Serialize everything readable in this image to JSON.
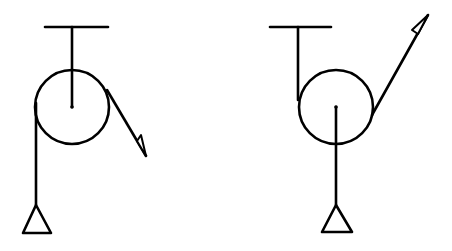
{
  "diagram": {
    "type": "pulley-systems",
    "background": "#ffffff",
    "line_color": "#000000",
    "figures": [
      {
        "id": "left",
        "ceiling": {
          "x1": 45,
          "x2": 108,
          "y": 27
        },
        "hanger": {
          "x": 72,
          "y1": 27,
          "y2": 107
        },
        "pulley": {
          "cx": 72,
          "cy": 107,
          "r": 37
        },
        "axle_dot": {
          "cx": 72,
          "cy": 107
        },
        "load_rope": {
          "x": 36,
          "y1": 103,
          "y2": 205
        },
        "load_triangle": {
          "apex": [
            37,
            205
          ],
          "base_left": [
            23,
            233
          ],
          "base_right": [
            53,
            233
          ]
        },
        "pull_rope": {
          "from": [
            107,
            90
          ],
          "to": [
            146,
            156
          ]
        },
        "arrowhead": {
          "tip": [
            146,
            156
          ],
          "back_on_line": [
            137,
            141
          ],
          "barb": [
            141,
            136
          ]
        }
      },
      {
        "id": "right",
        "ceiling": {
          "x1": 270,
          "x2": 330,
          "y": 27
        },
        "hanger": {
          "x": 298,
          "y1": 27,
          "y2": 100
        },
        "pulley": {
          "cx": 336,
          "cy": 107,
          "r": 37
        },
        "axle_dot": {
          "cx": 336,
          "cy": 107
        },
        "load_rope": {
          "x": 336,
          "y1": 107,
          "y2": 205
        },
        "load_triangle": {
          "apex": [
            336,
            205
          ],
          "base_left": [
            322,
            232
          ],
          "base_right": [
            352,
            232
          ]
        },
        "pull_rope": {
          "from": [
            372,
            115
          ],
          "to": [
            428,
            15
          ]
        },
        "arrowhead": {
          "tip": [
            428,
            15
          ],
          "back_on_line": [
            418,
            34
          ],
          "barb": [
            412,
            30
          ]
        }
      }
    ]
  }
}
